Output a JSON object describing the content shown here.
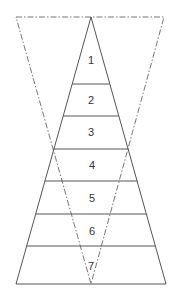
{
  "diagram": {
    "type": "layered-pyramid-with-inverted-dashed-triangle",
    "colors": {
      "line": "#555555",
      "dashed": "#666666",
      "text": "#333333",
      "background": "#ffffff"
    },
    "pyramid": {
      "apex": [
        91,
        17
      ],
      "base_left": [
        16,
        284
      ],
      "base_right": [
        166,
        284
      ]
    },
    "inverted_triangle": {
      "top_left": [
        16,
        17
      ],
      "top_right": [
        164,
        17
      ],
      "bottom": [
        91,
        284
      ],
      "style": "dash-dot"
    },
    "layers": [
      {
        "label": "1",
        "y_bottom": 84
      },
      {
        "label": "2",
        "y_bottom": 116
      },
      {
        "label": "3",
        "y_bottom": 149
      },
      {
        "label": "4",
        "y_bottom": 181
      },
      {
        "label": "5",
        "y_bottom": 214
      },
      {
        "label": "6",
        "y_bottom": 246
      },
      {
        "label": "7",
        "y_bottom": 284
      }
    ]
  }
}
